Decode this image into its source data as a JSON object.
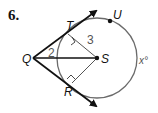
{
  "problem": {
    "number": "6."
  },
  "diagram": {
    "points": {
      "Q": "Q",
      "T": "T",
      "U": "U",
      "S": "S",
      "R": "R"
    },
    "segment_labels": {
      "QS_angle_or_segment": "2",
      "TS_radius": "3"
    },
    "arc_label": "x°",
    "colors": {
      "lines": "#111111",
      "circle": "#6b6b6b",
      "radius": "#555555",
      "label_numbers": "#555555"
    }
  }
}
